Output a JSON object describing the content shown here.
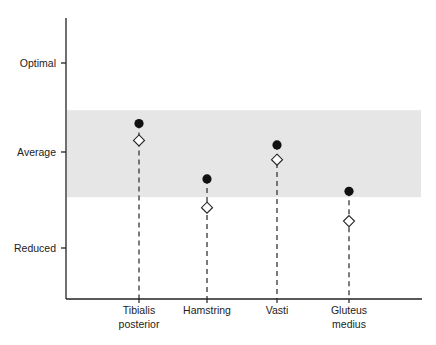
{
  "chart_data": {
    "type": "scatter",
    "title": "",
    "xlabel": "",
    "ylabel": "",
    "categories": [
      "Tibialis posterior",
      "Hamstring",
      "Vasti",
      "Gluteus medius"
    ],
    "category_lines": [
      [
        "Tibialis",
        "posterior"
      ],
      [
        "Hamstring"
      ],
      [
        "Vasti"
      ],
      [
        "Gluteus",
        "medius"
      ]
    ],
    "y_ticks": [
      {
        "label": "Reduced",
        "value": 1
      },
      {
        "label": "Average",
        "value": 2
      },
      {
        "label": "Optimal",
        "value": 3
      }
    ],
    "ylim": [
      0.45,
      3.5
    ],
    "average_band": {
      "low": 1.53,
      "high": 2.47,
      "color": "#e6e6e6"
    },
    "series": [
      {
        "name": "filled-circle",
        "marker": "circle",
        "color": "#111111",
        "values": [
          2.32,
          1.72,
          2.08,
          1.59
        ]
      },
      {
        "name": "open-diamond",
        "marker": "diamond",
        "color": "#ffffff",
        "values": [
          2.13,
          1.42,
          1.92,
          1.28
        ]
      }
    ],
    "grid": false,
    "legend": "none"
  }
}
